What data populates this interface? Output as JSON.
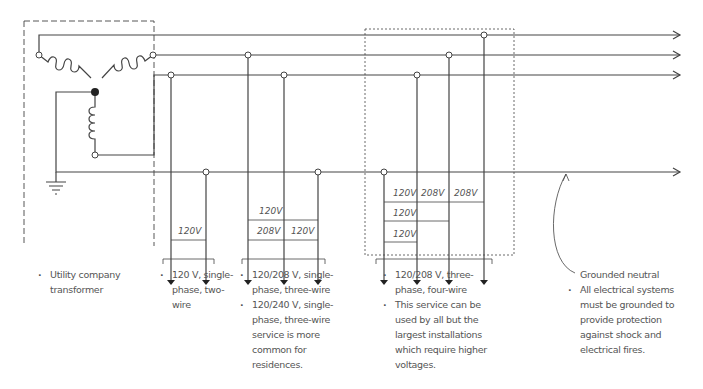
{
  "diagram": {
    "stroke_color": "#444444",
    "text_color": "#555555",
    "voltage_labels": {
      "two_wire": [
        "120V"
      ],
      "single_phase_three_wire": [
        "120V",
        "208V",
        "120V"
      ],
      "three_phase_four_wire": [
        "120V",
        "208V",
        "208V",
        "120V",
        "120V"
      ]
    }
  },
  "captions": {
    "transformer": {
      "bullets": [
        "Utility company transformer"
      ]
    },
    "two_wire": {
      "bullets": [
        "120 V, single-phase, two-wire"
      ]
    },
    "single_phase_three_wire": {
      "bullets": [
        "120/208 V, single-phase, three-wire",
        "120/240 V, single-phase, three-wire service is more common for residences."
      ]
    },
    "three_phase_four_wire": {
      "bullets": [
        "120/208 V, three-phase, four-wire",
        "This service can be used by all but the largest installations which require higher voltages."
      ]
    },
    "grounded_neutral": {
      "label": "Grounded neutral",
      "bullets": [
        "All electrical systems must be grounded to provide protection against shock and electrical fires."
      ]
    }
  }
}
